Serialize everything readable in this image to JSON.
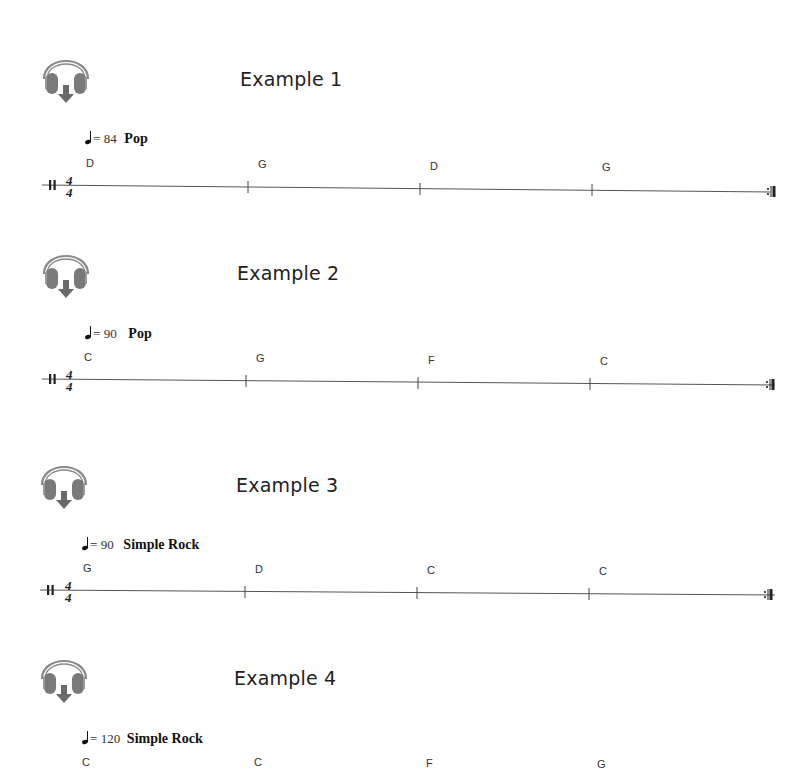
{
  "examples": [
    {
      "title": "Example 1",
      "tempo": {
        "bpm": "84",
        "style": "Pop",
        "equals": "="
      },
      "time_signature": {
        "top": "4",
        "bottom": "4"
      },
      "chords": [
        "D",
        "G",
        "D",
        "G"
      ],
      "icon": "headphones-download-icon"
    },
    {
      "title": "Example 2",
      "tempo": {
        "bpm": "90",
        "style": "Pop",
        "equals": "="
      },
      "time_signature": {
        "top": "4",
        "bottom": "4"
      },
      "chords": [
        "C",
        "G",
        "F",
        "C"
      ],
      "icon": "headphones-download-icon"
    },
    {
      "title": "Example 3",
      "tempo": {
        "bpm": "90",
        "style": "Simple Rock",
        "equals": "="
      },
      "time_signature": {
        "top": "4",
        "bottom": "4"
      },
      "chords": [
        "G",
        "D",
        "C",
        "C"
      ],
      "icon": "headphones-download-icon"
    },
    {
      "title": "Example 4",
      "tempo": {
        "bpm": "120",
        "style": "Simple Rock",
        "equals": "="
      },
      "time_signature": {
        "top": "4",
        "bottom": "4"
      },
      "chords": [
        "C",
        "C",
        "F",
        "G"
      ],
      "icon": "headphones-download-icon"
    }
  ],
  "colors": {
    "icon_gray": "#7a7a7a",
    "text": "#222222",
    "staff_line": "#555555"
  }
}
